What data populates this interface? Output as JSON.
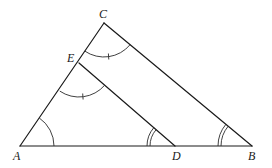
{
  "diagram": {
    "type": "geometry",
    "points": {
      "A": {
        "label": "A",
        "x": 20,
        "y": 146
      },
      "B": {
        "label": "B",
        "x": 252,
        "y": 146
      },
      "C": {
        "label": "C",
        "x": 104,
        "y": 23
      },
      "D": {
        "label": "D",
        "x": 175,
        "y": 146
      },
      "E": {
        "label": "E",
        "x": 79,
        "y": 63
      }
    },
    "segments": [
      {
        "from": "A",
        "to": "B"
      },
      {
        "from": "A",
        "to": "C"
      },
      {
        "from": "C",
        "to": "B"
      },
      {
        "from": "E",
        "to": "D"
      }
    ],
    "angle_marks": [
      {
        "vertex": "A",
        "style": "single-arc"
      },
      {
        "vertex": "C",
        "style": "single-arc-with-tick"
      },
      {
        "vertex": "E",
        "style": "single-arc-with-tick"
      },
      {
        "vertex": "D",
        "style": "double-arc"
      },
      {
        "vertex": "B",
        "style": "double-arc"
      }
    ]
  }
}
